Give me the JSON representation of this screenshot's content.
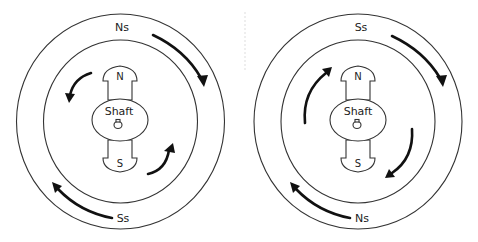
{
  "diagrams": [
    {
      "id": "left",
      "stator_top_label": "Ns",
      "stator_bottom_label": "Ss",
      "rotor_north_label": "N",
      "rotor_south_label": "S",
      "shaft_label": "Shaft",
      "stator_rotation": "clockwise",
      "rotor_rotation": "counter-clockwise"
    },
    {
      "id": "right",
      "stator_top_label": "Ss",
      "stator_bottom_label": "Ns",
      "rotor_north_label": "N",
      "rotor_south_label": "S",
      "shaft_label": "Shaft",
      "stator_rotation": "clockwise",
      "rotor_rotation": "clockwise"
    }
  ],
  "colors": {
    "line": "#333333",
    "arrow": "#111111",
    "background": "#ffffff"
  }
}
